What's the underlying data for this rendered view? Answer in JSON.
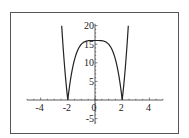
{
  "chart_data": {
    "type": "line",
    "title": "",
    "xlabel": "",
    "ylabel": "",
    "function": "y = |x^4 - 16|",
    "xlim": [
      -5,
      5
    ],
    "ylim": [
      -6.5,
      20.5
    ],
    "grid": false,
    "legend": null,
    "x_ticks": [
      -4,
      -2,
      0,
      2,
      4
    ],
    "x_tick_labels": [
      "-4",
      "-2",
      "0",
      "2",
      "4"
    ],
    "y_ticks": [
      20,
      15,
      10,
      5,
      -5
    ],
    "y_tick_labels": [
      "20",
      "15",
      "10",
      "5",
      "-5"
    ],
    "series": [
      {
        "name": "|x^4 - 16|",
        "x": [
          -2.449,
          -2.4,
          -2.3,
          -2.2,
          -2.1,
          -2.0,
          -1.9,
          -1.8,
          -1.6,
          -1.4,
          -1.2,
          -1.0,
          -0.8,
          -0.5,
          0,
          0.5,
          0.8,
          1.0,
          1.2,
          1.4,
          1.6,
          1.8,
          1.9,
          2.0,
          2.1,
          2.2,
          2.3,
          2.4,
          2.449
        ],
        "y": [
          20.0,
          17.18,
          11.98,
          7.43,
          3.45,
          0,
          2.97,
          5.5,
          9.45,
          12.16,
          13.93,
          15.0,
          15.59,
          15.94,
          16.0,
          15.94,
          15.59,
          15.0,
          13.93,
          12.16,
          9.45,
          5.5,
          2.97,
          0,
          3.45,
          7.43,
          11.98,
          17.18,
          20.0
        ]
      }
    ],
    "annotations": []
  },
  "colors": {
    "frame": "#555555",
    "axis": "#333333",
    "curve": "#222222",
    "background": "#ffffff"
  }
}
